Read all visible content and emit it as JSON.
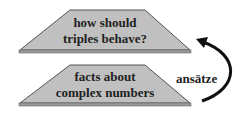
{
  "diagram": {
    "top_layer": {
      "line1": "how should",
      "line2": "triples behave?"
    },
    "bottom_layer": {
      "line1": "facts about",
      "line2": "complex numbers"
    },
    "arrow_label": "ansätze",
    "colors": {
      "fill": "#c0c0c0",
      "edge": "#555555",
      "slab": "#9a9a9a",
      "text": "#222222",
      "arrow": "#111111"
    }
  }
}
